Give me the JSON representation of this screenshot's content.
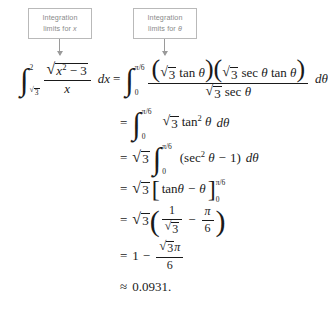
{
  "callouts": [
    {
      "id": "x",
      "line1": "Integration",
      "line2_pre": "limits for ",
      "line2_var": "x"
    },
    {
      "id": "theta",
      "line1": "Integration",
      "line2_pre": "limits for ",
      "line2_var": "θ"
    }
  ],
  "equation": {
    "line1": {
      "lhs": {
        "integral": {
          "upper": "2",
          "lower": "√3"
        },
        "numerator_radicand": "x² − 3",
        "denominator": "x",
        "differential": "dx"
      },
      "rhs": {
        "relation": "=",
        "integral": {
          "upper": "π/6",
          "lower": "0"
        },
        "numerator": "(√3 tan θ)(√3 sec θ tan θ)",
        "num_part1_radical": "3",
        "num_part1_rest": "tan θ",
        "num_part2_radical": "3",
        "num_part2_rest": "sec θ tan θ",
        "denominator_radical": "3",
        "denominator_rest": "sec θ",
        "differential": "dθ"
      }
    },
    "line2": {
      "relation": "=",
      "integral": {
        "upper": "π/6",
        "lower": "0"
      },
      "radical": "3",
      "expr": "tan",
      "exponent": "2",
      "variable": "θ",
      "differential": "dθ"
    },
    "line3": {
      "relation": "=",
      "radical": "3",
      "integral": {
        "upper": "π/6",
        "lower": "0"
      },
      "open_paren": "(",
      "expr": "sec",
      "exponent": "2",
      "variable": "θ",
      "minus": "−",
      "one": "1",
      "close_paren": ")",
      "differential": "dθ"
    },
    "line4": {
      "relation": "=",
      "radical": "3",
      "bracket_open": "[",
      "expr_pre": "tan ",
      "variable1": "θ",
      "minus": "−",
      "variable2": "θ",
      "bracket_close": "]",
      "upper": "π/6",
      "lower": "0"
    },
    "line5": {
      "relation": "=",
      "radical": "3",
      "open_paren": "(",
      "frac1_num": "1",
      "frac1_den_radical": "3",
      "minus": "−",
      "frac2_num": "π",
      "frac2_den": "6",
      "close_paren": ")"
    },
    "line6": {
      "relation": "=",
      "one": "1",
      "minus": "−",
      "num_radical": "3",
      "num_pi": "π",
      "den": "6"
    },
    "line7": {
      "relation": "≈",
      "value": "0.0931."
    }
  },
  "symbols": {
    "integral": "∫",
    "sqrt": "√",
    "theta": "θ",
    "pi": "π",
    "minus": "−",
    "approx": "≈",
    "equals": "="
  }
}
